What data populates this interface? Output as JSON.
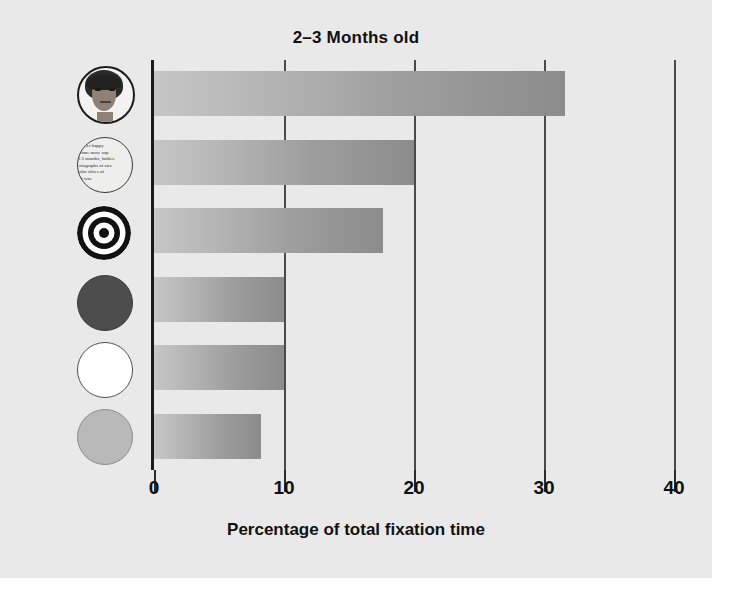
{
  "chart_data": {
    "type": "bar",
    "orientation": "horizontal",
    "title": "2–3 Months old",
    "xlabel": "Percentage of total fixation time",
    "ylabel": "Disks",
    "xlim": [
      0,
      43
    ],
    "xticks": [
      0,
      10,
      20,
      30,
      40
    ],
    "xtick_labels": [
      "0",
      "10",
      "20",
      "30",
      "40"
    ],
    "grid": true,
    "legend": false,
    "categories": [
      "face",
      "print",
      "bullseye",
      "red-disk",
      "white-disk",
      "yellow-disk"
    ],
    "category_labels": [
      "Face",
      "Printed text",
      "Bull's-eye",
      "Red disk",
      "White disk",
      "Yellow disk"
    ],
    "values": [
      31.6,
      20.0,
      17.6,
      10.0,
      10.0,
      8.2
    ],
    "bar_color_start": "#c6c6c6",
    "bar_color_end": "#8c8c8c"
  },
  "figure": {
    "background": "#e9e9e9",
    "axis_color": "#1a1a1a",
    "grid_color": "#4a4a4a",
    "text_color": "#111111"
  },
  "disks": {
    "print_disk_text": "prefer happy\ncome more sop\nt 3 months, babies\notographs of stra\nolor slices of\nht was",
    "icon_names": [
      "face-disk-icon",
      "printed-text-disk-icon",
      "bullseye-disk-icon",
      "red-disk-icon",
      "white-disk-icon",
      "yellow-disk-icon"
    ]
  }
}
